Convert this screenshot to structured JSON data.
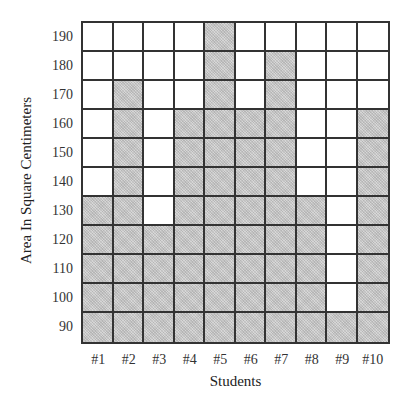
{
  "chart_data": {
    "type": "bar",
    "style": "shaded-grid column chart (each shaded square = 10 sq cm)",
    "title": "",
    "xlabel": "Students",
    "ylabel": "Area In Square Centimeters",
    "categories": [
      "#1",
      "#2",
      "#3",
      "#4",
      "#5",
      "#6",
      "#7",
      "#8",
      "#9",
      "#10"
    ],
    "values": [
      130,
      170,
      120,
      160,
      190,
      160,
      180,
      130,
      90,
      160
    ],
    "y_ticks": [
      190,
      180,
      170,
      160,
      150,
      140,
      130,
      120,
      110,
      100,
      90
    ],
    "ylim": [
      90,
      190
    ],
    "grid": true,
    "legend": null,
    "colors": {
      "filled": "#c9c9c9",
      "empty": "#ffffff",
      "grid_line": "#333333"
    }
  }
}
